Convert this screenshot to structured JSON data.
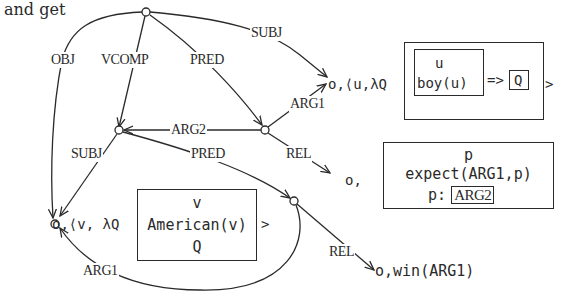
{
  "intro": "and get",
  "edge_labels": {
    "obj": "OBJ",
    "vcomp": "VCOMP",
    "pred_top": "PRED",
    "subj_top": "SUBJ",
    "arg1_top": "ARG1",
    "arg2": "ARG2",
    "subj_mid": "SUBJ",
    "pred_mid": "PRED",
    "rel_mid": "REL",
    "rel_bottom": "REL",
    "arg1_bottom": "ARG1"
  },
  "node_u": {
    "prefix": "o,⟨u,λQ",
    "drs_ref": "u",
    "drs_cond": "boy(u)",
    "arrow": "=>",
    "q": "Q",
    "close": ">"
  },
  "node_expect": {
    "prefix": "o,",
    "ref": "p",
    "cond": "expect(ARG1,p)",
    "p_label": "p:",
    "p_box": "ARG2"
  },
  "node_v": {
    "prefix": "o,⟨v, λQ",
    "ref": "v",
    "cond": "American(v)",
    "q": "Q",
    "close": ">"
  },
  "node_win": {
    "text": "o,win(ARG1)"
  }
}
